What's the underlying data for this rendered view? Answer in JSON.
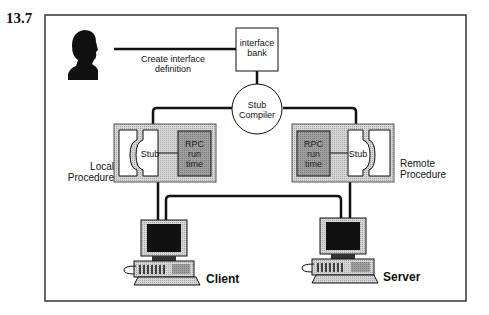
{
  "figure": {
    "number": "13.7"
  },
  "nodes": {
    "user": {
      "icon": "user-silhouette-icon"
    },
    "create_interface": {
      "label_line1": "Create interface",
      "label_line2": "definition"
    },
    "interface_bank": {
      "label_line1": "interface",
      "label_line2": "bank"
    },
    "stub_compiler": {
      "label_line1": "Stub",
      "label_line2": "Compiler"
    },
    "local_procedure": {
      "label_line1": "Local",
      "label_line2": "Procedure",
      "stub_label": "Stub",
      "runtime_line1": "RPC",
      "runtime_line2": "run",
      "runtime_line3": "time"
    },
    "remote_procedure": {
      "label_line1": "Remote",
      "label_line2": "Procedure",
      "stub_label": "Stub",
      "runtime_line1": "RPC",
      "runtime_line2": "run",
      "runtime_line3": "time"
    },
    "client": {
      "label": "Client",
      "icon": "computer-icon"
    },
    "server": {
      "label": "Server",
      "icon": "computer-icon"
    }
  },
  "colors": {
    "frame": "#333333",
    "panel": "#c8c8c8",
    "runtime": "#9a9a9a",
    "line": "#111111"
  }
}
